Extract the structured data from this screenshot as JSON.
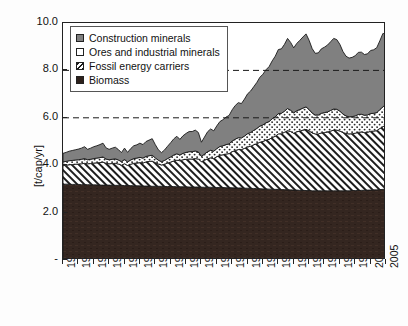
{
  "chart_data": {
    "type": "area",
    "title": "",
    "subtitle": "",
    "xlabel": "",
    "ylabel": "[t/cap/yr]",
    "ylim": [
      0,
      10
    ],
    "xlim": [
      1900,
      2005
    ],
    "grid": false,
    "stacked": true,
    "y_ticks": [
      "-",
      "2.0",
      "4.0",
      "6.0",
      "8.0",
      "10.0"
    ],
    "y_tick_values": [
      0,
      2,
      4,
      6,
      8,
      10
    ],
    "reference_lines": [
      6.0,
      8.0
    ],
    "legend_position": "top-left",
    "x": [
      1900,
      1901,
      1902,
      1903,
      1904,
      1905,
      1906,
      1907,
      1908,
      1909,
      1910,
      1911,
      1912,
      1913,
      1914,
      1915,
      1916,
      1917,
      1918,
      1919,
      1920,
      1921,
      1922,
      1923,
      1924,
      1925,
      1926,
      1927,
      1928,
      1929,
      1930,
      1931,
      1932,
      1933,
      1934,
      1935,
      1936,
      1937,
      1938,
      1939,
      1940,
      1941,
      1942,
      1943,
      1944,
      1945,
      1946,
      1947,
      1948,
      1949,
      1950,
      1951,
      1952,
      1953,
      1954,
      1955,
      1956,
      1957,
      1958,
      1959,
      1960,
      1961,
      1962,
      1963,
      1964,
      1965,
      1966,
      1967,
      1968,
      1969,
      1970,
      1971,
      1972,
      1973,
      1974,
      1975,
      1976,
      1977,
      1978,
      1979,
      1980,
      1981,
      1982,
      1983,
      1984,
      1985,
      1986,
      1987,
      1988,
      1989,
      1990,
      1991,
      1992,
      1993,
      1994,
      1995,
      1996,
      1997,
      1998,
      1999,
      2000,
      2001,
      2002,
      2003,
      2004,
      2005
    ],
    "tick_labels": [
      "1900",
      "1905",
      "1910",
      "1915",
      "1920",
      "1925",
      "1930",
      "1935",
      "1940",
      "1945",
      "1950",
      "1955",
      "1960",
      "1965",
      "1970",
      "1975",
      "1980",
      "1985",
      "1990",
      "1995",
      "2000",
      "2005"
    ],
    "series": [
      {
        "name": "Biomass",
        "pattern": "solid-dark",
        "color": "#342620",
        "values": [
          3.2,
          3.2,
          3.2,
          3.19,
          3.19,
          3.19,
          3.18,
          3.18,
          3.18,
          3.17,
          3.17,
          3.17,
          3.16,
          3.16,
          3.16,
          3.16,
          3.15,
          3.15,
          3.15,
          3.15,
          3.14,
          3.14,
          3.14,
          3.13,
          3.13,
          3.13,
          3.12,
          3.12,
          3.12,
          3.11,
          3.11,
          3.11,
          3.11,
          3.1,
          3.1,
          3.1,
          3.1,
          3.09,
          3.09,
          3.09,
          3.09,
          3.08,
          3.08,
          3.08,
          3.08,
          3.07,
          3.07,
          3.07,
          3.07,
          3.06,
          3.06,
          3.06,
          3.06,
          3.05,
          3.05,
          3.05,
          3.04,
          3.04,
          3.04,
          3.03,
          3.03,
          3.02,
          3.02,
          3.01,
          3.01,
          3.0,
          3.0,
          2.99,
          2.99,
          2.98,
          2.98,
          2.97,
          2.97,
          2.96,
          2.96,
          2.95,
          2.95,
          2.94,
          2.94,
          2.93,
          2.93,
          2.92,
          2.92,
          2.92,
          2.92,
          2.92,
          2.92,
          2.92,
          2.92,
          2.92,
          2.92,
          2.92,
          2.92,
          2.92,
          2.93,
          2.93,
          2.93,
          2.94,
          2.94,
          2.95,
          2.95,
          2.96,
          2.96,
          2.97,
          2.98,
          3.0
        ]
      },
      {
        "name": "Fossil energy carriers",
        "pattern": "diagonal-hatch",
        "color": "#ffffff",
        "values": [
          0.78,
          0.8,
          0.82,
          0.84,
          0.85,
          0.86,
          0.88,
          0.9,
          0.88,
          0.9,
          0.92,
          0.93,
          0.95,
          0.97,
          0.92,
          0.9,
          0.92,
          0.93,
          0.9,
          0.85,
          0.92,
          0.85,
          0.9,
          0.95,
          0.96,
          0.98,
          0.97,
          1.02,
          1.04,
          1.06,
          1.0,
          0.94,
          0.9,
          0.94,
          0.99,
          1.03,
          1.08,
          1.12,
          1.1,
          1.14,
          1.16,
          1.18,
          1.18,
          1.2,
          1.18,
          1.08,
          1.14,
          1.2,
          1.24,
          1.22,
          1.3,
          1.36,
          1.38,
          1.42,
          1.44,
          1.52,
          1.58,
          1.62,
          1.62,
          1.68,
          1.74,
          1.78,
          1.84,
          1.9,
          1.96,
          2.0,
          2.06,
          2.1,
          2.18,
          2.24,
          2.34,
          2.36,
          2.42,
          2.5,
          2.46,
          2.4,
          2.46,
          2.5,
          2.54,
          2.58,
          2.52,
          2.44,
          2.4,
          2.4,
          2.44,
          2.46,
          2.48,
          2.52,
          2.56,
          2.56,
          2.52,
          2.46,
          2.42,
          2.4,
          2.4,
          2.42,
          2.46,
          2.46,
          2.44,
          2.44,
          2.48,
          2.48,
          2.5,
          2.58,
          2.64,
          2.7
        ]
      },
      {
        "name": "Ores and industrial minerals",
        "pattern": "dotted",
        "color": "#ffffff",
        "values": [
          0.16,
          0.16,
          0.17,
          0.17,
          0.18,
          0.18,
          0.19,
          0.2,
          0.17,
          0.18,
          0.19,
          0.2,
          0.21,
          0.22,
          0.18,
          0.17,
          0.18,
          0.19,
          0.17,
          0.15,
          0.18,
          0.15,
          0.18,
          0.2,
          0.21,
          0.22,
          0.21,
          0.23,
          0.24,
          0.25,
          0.2,
          0.16,
          0.14,
          0.16,
          0.19,
          0.22,
          0.25,
          0.27,
          0.24,
          0.27,
          0.29,
          0.31,
          0.31,
          0.32,
          0.3,
          0.22,
          0.26,
          0.3,
          0.32,
          0.31,
          0.34,
          0.37,
          0.38,
          0.4,
          0.41,
          0.45,
          0.48,
          0.5,
          0.49,
          0.52,
          0.56,
          0.58,
          0.61,
          0.64,
          0.68,
          0.7,
          0.73,
          0.75,
          0.79,
          0.82,
          0.86,
          0.86,
          0.89,
          0.93,
          0.9,
          0.86,
          0.89,
          0.91,
          0.93,
          0.95,
          0.9,
          0.84,
          0.8,
          0.8,
          0.83,
          0.84,
          0.85,
          0.87,
          0.89,
          0.88,
          0.84,
          0.78,
          0.74,
          0.72,
          0.72,
          0.73,
          0.75,
          0.75,
          0.73,
          0.73,
          0.75,
          0.75,
          0.76,
          0.8,
          0.84,
          0.88
        ]
      },
      {
        "name": "Construction minerals",
        "pattern": "solid-gray",
        "color": "#808080",
        "values": [
          0.36,
          0.38,
          0.4,
          0.42,
          0.43,
          0.45,
          0.47,
          0.5,
          0.44,
          0.47,
          0.5,
          0.52,
          0.55,
          0.58,
          0.47,
          0.44,
          0.47,
          0.49,
          0.44,
          0.38,
          0.48,
          0.4,
          0.48,
          0.54,
          0.56,
          0.6,
          0.57,
          0.63,
          0.66,
          0.7,
          0.56,
          0.44,
          0.38,
          0.44,
          0.52,
          0.6,
          0.68,
          0.74,
          0.66,
          0.74,
          0.8,
          0.85,
          0.85,
          0.88,
          0.82,
          0.6,
          0.72,
          0.84,
          0.9,
          0.86,
          0.96,
          1.05,
          1.1,
          1.16,
          1.2,
          1.32,
          1.42,
          1.48,
          1.45,
          1.56,
          1.68,
          1.75,
          1.84,
          1.94,
          2.06,
          2.14,
          2.24,
          2.32,
          2.44,
          2.56,
          2.7,
          2.72,
          2.82,
          2.96,
          2.86,
          2.74,
          2.84,
          2.92,
          3.0,
          3.08,
          2.92,
          2.72,
          2.6,
          2.62,
          2.72,
          2.76,
          2.82,
          2.9,
          2.98,
          2.94,
          2.82,
          2.64,
          2.52,
          2.48,
          2.5,
          2.54,
          2.62,
          2.62,
          2.56,
          2.58,
          2.66,
          2.68,
          2.74,
          2.9,
          3.1,
          2.94
        ]
      }
    ]
  },
  "legend": {
    "items": [
      {
        "label": "Construction minerals",
        "swatch": "construction-swatch"
      },
      {
        "label": "Ores and industrial minerals",
        "swatch": "ores-swatch"
      },
      {
        "label": "Fossil energy carriers",
        "swatch": "fossil-swatch"
      },
      {
        "label": "Biomass",
        "swatch": "biomass-swatch"
      }
    ]
  },
  "colors": {
    "biomass": "#342620",
    "fossil_line": "#1a1a1a",
    "ores_line": "#1a1a1a",
    "construction": "#808080",
    "axis": "#222222",
    "background": "#ffffff"
  }
}
